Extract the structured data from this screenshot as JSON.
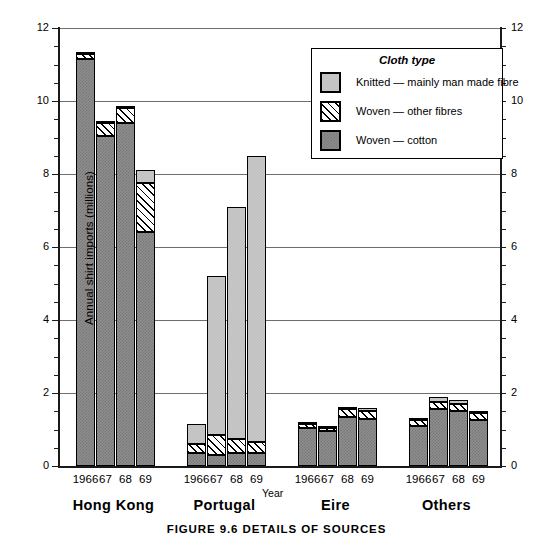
{
  "chart_data": {
    "type": "bar",
    "subtype": "stacked-bar-grouped",
    "title": "",
    "caption": "FIGURE 9.6   DETAILS OF SOURCES",
    "xlabel": "Year",
    "ylabel": "Annual shirt imports (millions)",
    "ylim": [
      0,
      12
    ],
    "yticks": [
      0,
      2,
      4,
      6,
      8,
      10,
      12
    ],
    "ytick_labels": [
      "0",
      "2",
      "4",
      "6",
      "8",
      "10",
      "12"
    ],
    "y_minor_step": 0.5,
    "dual_axis": true,
    "grid": "horizontal",
    "legend_position": "upper-right",
    "legend_title": "Cloth type",
    "categories": [
      "1966",
      "67",
      "68",
      "69"
    ],
    "groups": [
      "Hong Kong",
      "Portugal",
      "Eire",
      "Others"
    ],
    "series": [
      {
        "name": "Woven — cotton",
        "key": "woven-cotton",
        "color": "#8e8e8e",
        "pattern": "dark-stipple",
        "values": {
          "Hong Kong": [
            11.15,
            9.05,
            9.4,
            6.4
          ],
          "Portugal": [
            0.35,
            0.3,
            0.35,
            0.35
          ],
          "Eire": [
            1.05,
            0.95,
            1.35,
            1.3
          ],
          "Others": [
            1.1,
            1.55,
            1.5,
            1.25
          ]
        }
      },
      {
        "name": "Woven — other fibres",
        "key": "woven-other",
        "color": "#ffffff",
        "pattern": "diagonal-hatch",
        "values": {
          "Hong Kong": [
            0.15,
            0.35,
            0.4,
            1.35
          ],
          "Portugal": [
            0.25,
            0.55,
            0.4,
            0.3
          ],
          "Eire": [
            0.1,
            0.1,
            0.2,
            0.2
          ],
          "Others": [
            0.15,
            0.2,
            0.2,
            0.2
          ]
        }
      },
      {
        "name": "Knitted — mainly man made fibre",
        "key": "knitted",
        "color": "#c9c9c9",
        "pattern": "light-stipple",
        "values": {
          "Hong Kong": [
            0.05,
            0.05,
            0.05,
            0.35
          ],
          "Portugal": [
            0.55,
            4.35,
            6.35,
            7.85
          ],
          "Eire": [
            0.05,
            0.05,
            0.05,
            0.1
          ],
          "Others": [
            0.05,
            0.15,
            0.1,
            0.05
          ]
        }
      }
    ],
    "totals": {
      "Hong Kong": [
        11.35,
        9.45,
        9.85,
        8.1
      ],
      "Portugal": [
        1.15,
        5.2,
        7.1,
        8.5
      ],
      "Eire": [
        1.2,
        1.1,
        1.6,
        1.6
      ],
      "Others": [
        1.3,
        1.9,
        1.8,
        1.5
      ]
    }
  },
  "axes": {
    "ylabel": "Annual shirt imports (millions)",
    "xlabel": "Year",
    "left_ticks": [
      "12",
      "10",
      "8",
      "6",
      "4",
      "2",
      "0"
    ],
    "right_ticks": [
      "12",
      "10",
      "8",
      "6",
      "4",
      "2",
      "0"
    ]
  },
  "legend": {
    "title": "Cloth type",
    "items": [
      {
        "label": "Knitted — mainly man made fibre",
        "key": "knitted"
      },
      {
        "label": "Woven — other fibres",
        "key": "woven-other"
      },
      {
        "label": "Woven — cotton",
        "key": "woven-cotton"
      }
    ]
  },
  "groups": [
    {
      "name": "Hong Kong",
      "years": [
        "1966",
        "67",
        "68",
        "69"
      ]
    },
    {
      "name": "Portugal",
      "years": [
        "1966",
        "67",
        "68",
        "69"
      ]
    },
    {
      "name": "Eire",
      "years": [
        "1966",
        "67",
        "68",
        "69"
      ]
    },
    {
      "name": "Others",
      "years": [
        "1966",
        "67",
        "68",
        "69"
      ]
    }
  ],
  "caption": "FIGURE 9.6   DETAILS OF SOURCES"
}
